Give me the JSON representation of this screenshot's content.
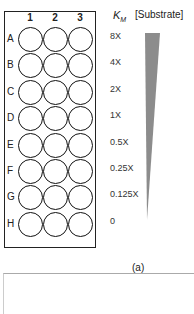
{
  "figure": {
    "columns": [
      "1",
      "2",
      "3"
    ],
    "rows": [
      "A",
      "B",
      "C",
      "D",
      "E",
      "F",
      "G",
      "H"
    ],
    "km_header": "K",
    "km_header_sub": "M",
    "substrate_header": "[Substrate]",
    "km_values": [
      "8X",
      "4X",
      "2X",
      "1X",
      "0.5X",
      "0.25X",
      "0.125X",
      "0"
    ],
    "wedge_color": "#8c8c8c",
    "caption": "(a)"
  }
}
